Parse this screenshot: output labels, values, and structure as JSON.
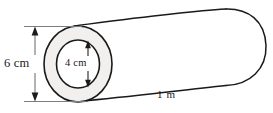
{
  "figure": {
    "shape_name": "hollow-cylinder",
    "background_color": "#ffffff",
    "stroke_color": "#1a1a1a",
    "annulus_fill_color": "#f1f0ee",
    "body_fill_color": "#ffffff"
  },
  "labels": {
    "outer_diameter": "6 cm",
    "inner_diameter": "4 cm",
    "length": "1 m"
  },
  "geometry": {
    "front_face_center": {
      "x": 78,
      "y": 64
    },
    "outer_ellipse_radius": {
      "rx": 34,
      "ry": 38
    },
    "inner_ellipse_radius": {
      "rx": 21.5,
      "ry": 24
    },
    "right_cap_center": {
      "x": 243,
      "y": 47
    },
    "length_axis": "left-to-right, sloping upward"
  },
  "dimension_lines": {
    "outer_diameter_line": {
      "orientation": "vertical",
      "x": 35,
      "y_top": 27,
      "y_bottom": 101,
      "arrowheads": "both-ends"
    },
    "inner_diameter_line": {
      "orientation": "vertical",
      "x": 88,
      "y_top": 41,
      "y_bottom": 87,
      "arrowheads": "both-ends"
    }
  }
}
